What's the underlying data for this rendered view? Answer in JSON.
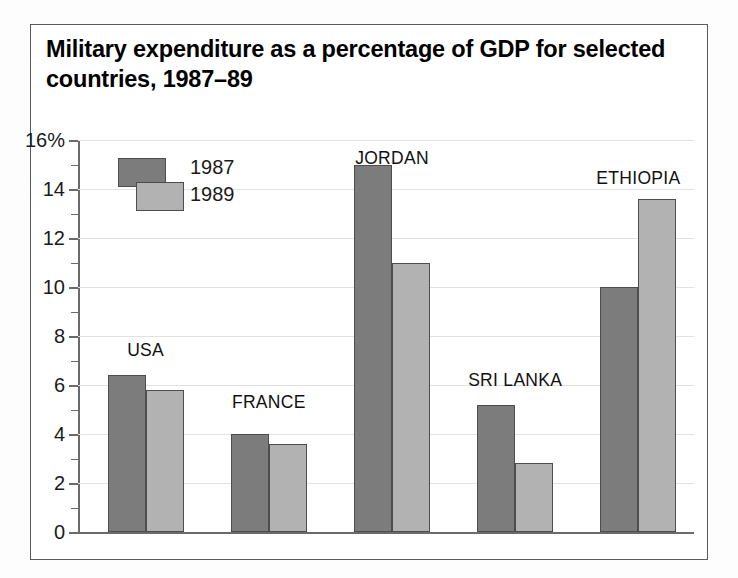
{
  "chart_data": {
    "type": "bar",
    "title": "Military expenditure as a percentage of GDP for selected countries, 1987–89",
    "xlabel": "",
    "ylabel": "",
    "ytick_suffix": "%",
    "ylim": [
      0,
      16
    ],
    "ytick_labels": [
      "0",
      "2",
      "4",
      "6",
      "8",
      "10",
      "12",
      "14",
      "16%"
    ],
    "ytick_values": [
      0,
      2,
      4,
      6,
      8,
      10,
      12,
      14,
      16
    ],
    "minor_tick_step": 1,
    "grid": true,
    "legend_position": "upper-left-inside",
    "categories": [
      "USA",
      "FRANCE",
      "JORDAN",
      "SRI LANKA",
      "ETHIOPIA"
    ],
    "series": [
      {
        "name": "1987",
        "color": "#7c7c7c",
        "values": [
          6.4,
          4.0,
          15.0,
          5.2,
          10.0
        ]
      },
      {
        "name": "1989",
        "color": "#b2b2b2",
        "values": [
          5.8,
          3.6,
          11.0,
          2.8,
          13.6
        ]
      }
    ]
  },
  "figure": {
    "border_color": "#5a5a5a",
    "background": "#ffffff"
  }
}
